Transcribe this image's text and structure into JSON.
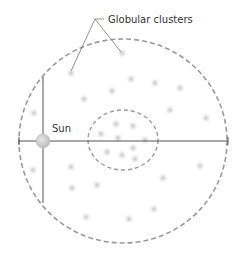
{
  "diagram": {
    "title_label": "Globular clusters",
    "sun_label": "Sun",
    "colors": {
      "outline": "#9a9a9a",
      "axis": "#555555",
      "leader": "#777777",
      "cluster": "#cfcfcf",
      "sun_fill": "#d4d4d4",
      "text": "#333333"
    },
    "outer_circle": {
      "cx": 123,
      "cy": 141,
      "rx": 104,
      "ry": 102
    },
    "inner_ellipse": {
      "cx": 123,
      "cy": 140,
      "rx": 35,
      "ry": 30
    },
    "sun": {
      "cx": 43,
      "cy": 141,
      "r": 7
    },
    "clusters": [
      [
        71,
        73
      ],
      [
        122,
        53
      ],
      [
        131,
        79
      ],
      [
        155,
        83
      ],
      [
        180,
        88
      ],
      [
        112,
        91
      ],
      [
        84,
        99
      ],
      [
        34,
        113
      ],
      [
        170,
        110
      ],
      [
        206,
        118
      ],
      [
        33,
        170
      ],
      [
        71,
        167
      ],
      [
        72,
        188
      ],
      [
        97,
        185
      ],
      [
        135,
        159
      ],
      [
        163,
        178
      ],
      [
        200,
        166
      ],
      [
        86,
        217
      ],
      [
        154,
        209
      ],
      [
        129,
        219
      ],
      [
        101,
        134
      ],
      [
        116,
        124
      ],
      [
        133,
        126
      ],
      [
        118,
        138
      ],
      [
        145,
        140
      ],
      [
        107,
        152
      ],
      [
        122,
        155
      ],
      [
        133,
        148
      ]
    ]
  }
}
